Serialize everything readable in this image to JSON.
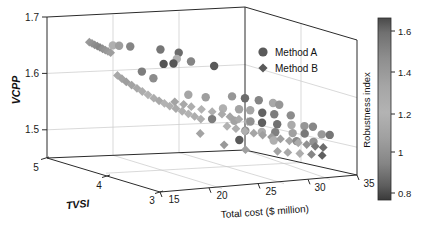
{
  "chart_data": {
    "type": "scatter",
    "dimensions": "3d",
    "title": "",
    "xlabel": "Total cost ($ million)",
    "ylabel": "TVSI",
    "zlabel": "VCPP",
    "xlim": [
      13,
      35
    ],
    "ylim": [
      2.6,
      5.2
    ],
    "zlim": [
      1.46,
      1.71
    ],
    "xticks": [
      "15",
      "20",
      "25",
      "30",
      "35"
    ],
    "xtick_values": [
      15,
      20,
      25,
      30,
      35
    ],
    "yticks": [
      "5",
      "4",
      "3"
    ],
    "ytick_values": [
      5,
      4,
      3
    ],
    "zticks": [
      "1.7",
      "1.6",
      "1.5"
    ],
    "ztick_values": [
      1.7,
      1.6,
      1.5
    ],
    "grid": true,
    "legend_position": "upper-right-inside",
    "colorbar": {
      "title": "Robustness index",
      "ticks": [
        "1.6",
        "1.4",
        "1.2",
        "1",
        "0.8"
      ],
      "tick_values": [
        1.6,
        1.4,
        1.2,
        1.0,
        0.8
      ],
      "vmin": 0.75,
      "vmax": 1.72,
      "colormap": "gray-inverted",
      "low_color": "#3a3a3a",
      "mid_color": "#b5b5b5",
      "high_color": "#4a4a4a"
    },
    "series": [
      {
        "name": "Method A",
        "marker": "circle",
        "points": [
          {
            "x": 17.2,
            "y": 4.55,
            "z": 1.672,
            "c": 1.22
          },
          {
            "x": 17.9,
            "y": 4.55,
            "z": 1.671,
            "c": 1.32
          },
          {
            "x": 18.9,
            "y": 4.5,
            "z": 1.67,
            "c": 1.05
          },
          {
            "x": 21.3,
            "y": 4.3,
            "z": 1.668,
            "c": 1.48
          },
          {
            "x": 23.1,
            "y": 4.25,
            "z": 1.662,
            "c": 1.52
          },
          {
            "x": 22.4,
            "y": 4.15,
            "z": 1.654,
            "c": 1.25
          },
          {
            "x": 23.5,
            "y": 4.05,
            "z": 1.651,
            "c": 1.42
          },
          {
            "x": 20.2,
            "y": 4.0,
            "z": 1.65,
            "c": 0.85
          },
          {
            "x": 21.3,
            "y": 4.0,
            "z": 1.65,
            "c": 0.86
          },
          {
            "x": 25.6,
            "y": 3.95,
            "z": 1.644,
            "c": 0.88
          },
          {
            "x": 18.5,
            "y": 4.15,
            "z": 1.634,
            "c": 1.02
          },
          {
            "x": 19.3,
            "y": 4.05,
            "z": 1.624,
            "c": 1.08
          },
          {
            "x": 21.6,
            "y": 3.72,
            "z": 1.601,
            "c": 1.18
          },
          {
            "x": 23.2,
            "y": 3.65,
            "z": 1.597,
            "c": 1.15
          },
          {
            "x": 25.9,
            "y": 3.6,
            "z": 1.598,
            "c": 1.35
          },
          {
            "x": 27.1,
            "y": 3.55,
            "z": 1.595,
            "c": 0.95
          },
          {
            "x": 28.4,
            "y": 3.5,
            "z": 1.592,
            "c": 1.05
          },
          {
            "x": 29.6,
            "y": 3.42,
            "z": 1.588,
            "c": 1.28
          },
          {
            "x": 30.2,
            "y": 3.4,
            "z": 1.585,
            "c": 1.12
          },
          {
            "x": 24.4,
            "y": 3.5,
            "z": 1.58,
            "c": 1.22
          },
          {
            "x": 26.1,
            "y": 3.48,
            "z": 1.578,
            "c": 1.3
          },
          {
            "x": 27.2,
            "y": 3.45,
            "z": 1.576,
            "c": 1.18
          },
          {
            "x": 28.3,
            "y": 3.4,
            "z": 1.572,
            "c": 0.92
          },
          {
            "x": 29.4,
            "y": 3.35,
            "z": 1.57,
            "c": 1.45
          },
          {
            "x": 31.0,
            "y": 3.3,
            "z": 1.568,
            "c": 1.08
          },
          {
            "x": 22.6,
            "y": 3.38,
            "z": 1.565,
            "c": 1.02
          },
          {
            "x": 24.8,
            "y": 3.32,
            "z": 1.562,
            "c": 1.3
          },
          {
            "x": 26.5,
            "y": 3.3,
            "z": 1.56,
            "c": 1.1
          },
          {
            "x": 27.6,
            "y": 3.26,
            "z": 1.558,
            "c": 0.9
          },
          {
            "x": 29.0,
            "y": 3.2,
            "z": 1.556,
            "c": 1.5
          },
          {
            "x": 30.5,
            "y": 3.18,
            "z": 1.554,
            "c": 1.2
          },
          {
            "x": 31.8,
            "y": 3.15,
            "z": 1.552,
            "c": 1.12
          },
          {
            "x": 32.6,
            "y": 3.12,
            "z": 1.551,
            "c": 1.06
          },
          {
            "x": 25.2,
            "y": 3.15,
            "z": 1.548,
            "c": 1.38
          },
          {
            "x": 26.8,
            "y": 3.1,
            "z": 1.546,
            "c": 1.26
          },
          {
            "x": 28.2,
            "y": 3.08,
            "z": 1.545,
            "c": 1.44
          },
          {
            "x": 30.0,
            "y": 3.05,
            "z": 1.543,
            "c": 1.16
          },
          {
            "x": 31.2,
            "y": 3.02,
            "z": 1.542,
            "c": 1.0
          },
          {
            "x": 33.0,
            "y": 3.0,
            "z": 1.54,
            "c": 1.34
          },
          {
            "x": 33.8,
            "y": 2.98,
            "z": 1.539,
            "c": 1.48
          },
          {
            "x": 23.8,
            "y": 3.0,
            "z": 1.536,
            "c": 0.88
          },
          {
            "x": 27.4,
            "y": 2.95,
            "z": 1.534,
            "c": 1.22
          },
          {
            "x": 29.8,
            "y": 2.92,
            "z": 1.532,
            "c": 1.4
          },
          {
            "x": 31.6,
            "y": 2.9,
            "z": 1.53,
            "c": 1.1
          }
        ]
      },
      {
        "name": "Method B",
        "marker": "diamond",
        "points": [
          {
            "x": 15.4,
            "y": 4.72,
            "z": 1.675,
            "c": 1.34
          },
          {
            "x": 15.6,
            "y": 4.7,
            "z": 1.673,
            "c": 1.36
          },
          {
            "x": 15.8,
            "y": 4.68,
            "z": 1.671,
            "c": 1.38
          },
          {
            "x": 16.0,
            "y": 4.66,
            "z": 1.669,
            "c": 1.4
          },
          {
            "x": 16.2,
            "y": 4.64,
            "z": 1.667,
            "c": 1.42
          },
          {
            "x": 16.4,
            "y": 4.62,
            "z": 1.665,
            "c": 1.38
          },
          {
            "x": 16.6,
            "y": 4.6,
            "z": 1.663,
            "c": 1.36
          },
          {
            "x": 16.8,
            "y": 4.58,
            "z": 1.661,
            "c": 1.34
          },
          {
            "x": 17.0,
            "y": 4.56,
            "z": 1.659,
            "c": 1.32
          },
          {
            "x": 16.5,
            "y": 4.3,
            "z": 1.625,
            "c": 1.28
          },
          {
            "x": 16.8,
            "y": 4.26,
            "z": 1.62,
            "c": 1.3
          },
          {
            "x": 17.1,
            "y": 4.22,
            "z": 1.615,
            "c": 1.32
          },
          {
            "x": 17.5,
            "y": 4.18,
            "z": 1.61,
            "c": 1.3
          },
          {
            "x": 17.9,
            "y": 4.14,
            "z": 1.605,
            "c": 1.28
          },
          {
            "x": 18.3,
            "y": 4.1,
            "z": 1.6,
            "c": 1.26
          },
          {
            "x": 18.7,
            "y": 4.05,
            "z": 1.595,
            "c": 1.24
          },
          {
            "x": 19.1,
            "y": 4.0,
            "z": 1.59,
            "c": 1.26
          },
          {
            "x": 19.5,
            "y": 3.96,
            "z": 1.586,
            "c": 1.28
          },
          {
            "x": 19.9,
            "y": 3.92,
            "z": 1.582,
            "c": 1.24
          },
          {
            "x": 20.3,
            "y": 3.88,
            "z": 1.578,
            "c": 1.22
          },
          {
            "x": 20.8,
            "y": 3.84,
            "z": 1.574,
            "c": 1.2
          },
          {
            "x": 21.3,
            "y": 3.8,
            "z": 1.57,
            "c": 1.22
          },
          {
            "x": 21.8,
            "y": 3.76,
            "z": 1.566,
            "c": 1.24
          },
          {
            "x": 22.3,
            "y": 3.72,
            "z": 1.562,
            "c": 1.26
          },
          {
            "x": 22.8,
            "y": 3.68,
            "z": 1.558,
            "c": 1.22
          },
          {
            "x": 19.6,
            "y": 3.62,
            "z": 1.592,
            "c": 1.3
          },
          {
            "x": 20.4,
            "y": 3.58,
            "z": 1.588,
            "c": 1.28
          },
          {
            "x": 21.1,
            "y": 3.55,
            "z": 1.584,
            "c": 1.26
          },
          {
            "x": 22.0,
            "y": 3.5,
            "z": 1.58,
            "c": 1.24
          },
          {
            "x": 23.0,
            "y": 3.46,
            "z": 1.576,
            "c": 1.22
          },
          {
            "x": 23.9,
            "y": 3.42,
            "z": 1.572,
            "c": 1.2
          },
          {
            "x": 24.6,
            "y": 3.38,
            "z": 1.568,
            "c": 1.18
          },
          {
            "x": 25.4,
            "y": 3.34,
            "z": 1.564,
            "c": 1.2
          },
          {
            "x": 26.2,
            "y": 3.3,
            "z": 1.56,
            "c": 1.22
          },
          {
            "x": 23.4,
            "y": 3.2,
            "z": 1.556,
            "c": 1.24
          },
          {
            "x": 24.2,
            "y": 3.16,
            "z": 1.552,
            "c": 1.26
          },
          {
            "x": 25.0,
            "y": 3.12,
            "z": 1.548,
            "c": 1.22
          },
          {
            "x": 25.8,
            "y": 3.08,
            "z": 1.545,
            "c": 1.18
          },
          {
            "x": 26.6,
            "y": 3.04,
            "z": 1.542,
            "c": 1.16
          },
          {
            "x": 27.4,
            "y": 3.0,
            "z": 1.539,
            "c": 1.14
          },
          {
            "x": 28.2,
            "y": 2.96,
            "z": 1.536,
            "c": 1.16
          },
          {
            "x": 29.0,
            "y": 2.92,
            "z": 1.533,
            "c": 1.18
          },
          {
            "x": 29.8,
            "y": 2.88,
            "z": 1.53,
            "c": 1.2
          },
          {
            "x": 30.6,
            "y": 2.85,
            "z": 1.527,
            "c": 1.1
          },
          {
            "x": 31.4,
            "y": 2.82,
            "z": 1.524,
            "c": 1.0
          },
          {
            "x": 32.2,
            "y": 2.8,
            "z": 1.522,
            "c": 0.95
          },
          {
            "x": 27.0,
            "y": 2.78,
            "z": 1.519,
            "c": 1.3
          },
          {
            "x": 28.0,
            "y": 2.75,
            "z": 1.517,
            "c": 1.28
          },
          {
            "x": 29.2,
            "y": 2.72,
            "z": 1.515,
            "c": 1.26
          },
          {
            "x": 30.4,
            "y": 2.7,
            "z": 1.513,
            "c": 1.05
          },
          {
            "x": 31.5,
            "y": 2.68,
            "z": 1.511,
            "c": 0.9
          },
          {
            "x": 24.0,
            "y": 2.9,
            "z": 1.521,
            "c": 1.32
          },
          {
            "x": 22.2,
            "y": 3.02,
            "z": 1.528,
            "c": 1.34
          },
          {
            "x": 20.6,
            "y": 3.24,
            "z": 1.544,
            "c": 1.3
          }
        ]
      }
    ]
  },
  "legend": {
    "items": [
      {
        "label": "Method A",
        "marker": "circle"
      },
      {
        "label": "Method B",
        "marker": "diamond"
      }
    ]
  }
}
